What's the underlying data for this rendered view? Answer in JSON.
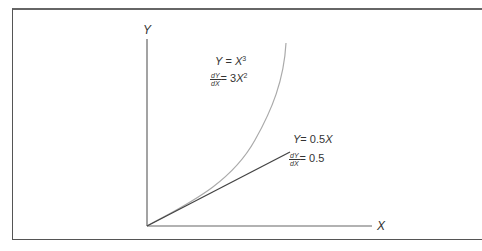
{
  "diagram": {
    "axes": {
      "y_label": "Y",
      "x_label": "X"
    },
    "curves": [
      {
        "name": "cubic",
        "equation": "Y = X^3",
        "equation_lhs": "Y",
        "equation_rhs_base": "X",
        "equation_rhs_exp": "3",
        "derivative_num": "dY",
        "derivative_den": "dX",
        "derivative_value_prefix": "= 3",
        "derivative_value_base": "X",
        "derivative_value_exp": "2",
        "color": "#aaaaaa"
      },
      {
        "name": "linear",
        "equation": "Y = 0.5X",
        "equation_lhs": "Y",
        "equation_rhs": "= 0.5",
        "equation_rhs_var": "X",
        "derivative_num": "dY",
        "derivative_den": "dX",
        "derivative_value": "= 0.5",
        "color": "#444444"
      }
    ]
  }
}
